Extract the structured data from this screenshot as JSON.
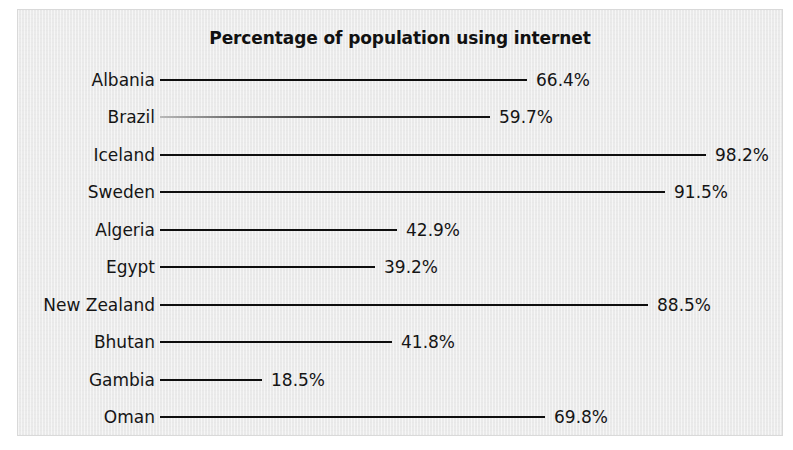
{
  "page": {
    "background_color": "#ffffff",
    "panel_background_color": "#eaeaea",
    "line_color": "#0e0e0e",
    "text_color": "#151515"
  },
  "chart_data": {
    "type": "bar",
    "orientation": "horizontal",
    "title": "Percentage of population using internet",
    "xlabel": "",
    "ylabel": "",
    "grid": false,
    "legend": false,
    "value_suffix": "%",
    "xlim": [
      0,
      100
    ],
    "categories": [
      "Albania",
      "Brazil",
      "Iceland",
      "Sweden",
      "Algeria",
      "Egypt",
      "New Zealand",
      "Bhutan",
      "Gambia",
      "Oman"
    ],
    "values": [
      66.4,
      59.7,
      98.2,
      91.5,
      42.9,
      39.2,
      88.5,
      41.8,
      18.5,
      69.8
    ],
    "value_labels": [
      "66.4%",
      "59.7%",
      "98.2%",
      "91.5%",
      "42.9%",
      "39.2%",
      "88.5%",
      "41.8%",
      "18.5%",
      "69.8%"
    ],
    "rows": [
      {
        "label": "Albania",
        "value": 66.4,
        "value_label": "66.4%",
        "y": 70,
        "line_start": 142,
        "line_end": 509,
        "faded": false
      },
      {
        "label": "Brazil",
        "value": 59.7,
        "value_label": "59.7%",
        "y": 107,
        "line_start": 142,
        "line_end": 472,
        "faded": true
      },
      {
        "label": "Iceland",
        "value": 98.2,
        "value_label": "98.2%",
        "y": 145,
        "line_start": 142,
        "line_end": 688,
        "faded": false
      },
      {
        "label": "Sweden",
        "value": 91.5,
        "value_label": "91.5%",
        "y": 182,
        "line_start": 142,
        "line_end": 647,
        "faded": false
      },
      {
        "label": "Algeria",
        "value": 42.9,
        "value_label": "42.9%",
        "y": 220,
        "line_start": 142,
        "line_end": 379,
        "faded": false
      },
      {
        "label": "Egypt",
        "value": 39.2,
        "value_label": "39.2%",
        "y": 257,
        "line_start": 142,
        "line_end": 357,
        "faded": false
      },
      {
        "label": "New Zealand",
        "value": 88.5,
        "value_label": "88.5%",
        "y": 295,
        "line_start": 142,
        "line_end": 630,
        "faded": false
      },
      {
        "label": "Bhutan",
        "value": 41.8,
        "value_label": "41.8%",
        "y": 332,
        "line_start": 142,
        "line_end": 374,
        "faded": false
      },
      {
        "label": "Gambia",
        "value": 18.5,
        "value_label": "18.5%",
        "y": 370,
        "line_start": 142,
        "line_end": 244,
        "faded": false
      },
      {
        "label": "Oman",
        "value": 69.8,
        "value_label": "69.8%",
        "y": 407,
        "line_start": 142,
        "line_end": 527,
        "faded": false
      }
    ]
  }
}
